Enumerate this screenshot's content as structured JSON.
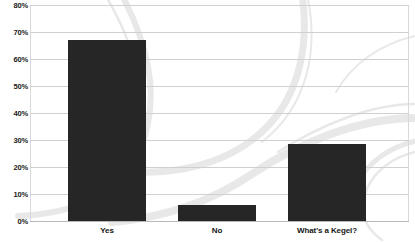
{
  "chart_data": {
    "type": "bar",
    "title": "",
    "subtitle": "",
    "xlabel": "",
    "ylabel": "",
    "categories": [
      "Yes",
      "No",
      "What's a Kegel?"
    ],
    "values": [
      67,
      6,
      28.5
    ],
    "value_labels": [
      "67%",
      "6%",
      "28.5%"
    ],
    "ylim": [
      0,
      80
    ],
    "ytick_labels": [
      "0%",
      "10%",
      "20%",
      "30%",
      "40%",
      "50%",
      "60%",
      "70%",
      "80%"
    ],
    "ytick_values": [
      0,
      10,
      20,
      30,
      40,
      50,
      60,
      70,
      80
    ],
    "grid": true,
    "legend": "none",
    "series": [
      {
        "name": "Response share",
        "values": [
          67,
          6,
          28.5
        ]
      }
    ]
  },
  "style": {
    "bar_color": "#262626",
    "grid_color": "#d0d0d0",
    "frame_color": "#d9d9d9",
    "baseline_color": "#b8b8b8",
    "background_color": "#ffffff",
    "watermark_color": "#e6e6e6",
    "tick_text_color": "#1a1a1a",
    "category_text_color": "#161616"
  },
  "watermark": {
    "name": "swirl-arcs",
    "description": "faint light gray curved ribbon arcs"
  }
}
